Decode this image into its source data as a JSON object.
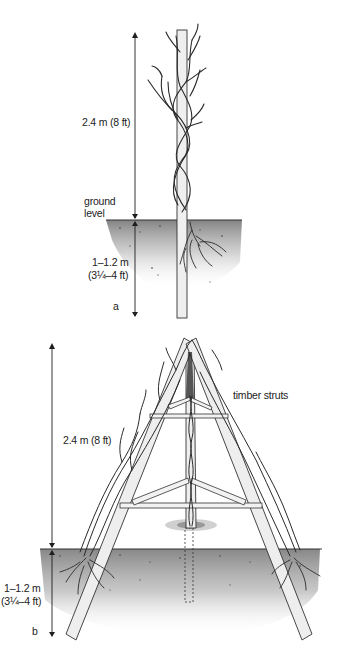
{
  "figure_a": {
    "panel_letter": "a",
    "height_above_label": "2.4 m (8 ft)",
    "ground_label_line1": "ground",
    "ground_label_line2": "level",
    "depth_label_line1": "1–1.2 m",
    "depth_label_line2": "(3¼–4 ft)",
    "support_type": "single-post",
    "icon": "vine-on-post-icon"
  },
  "figure_b": {
    "panel_letter": "b",
    "height_above_label": "2.4 m (8 ft)",
    "struts_label": "timber struts",
    "depth_label_line1": "1–1.2 m",
    "depth_label_line2": "(3¼–4 ft)",
    "support_type": "tripod",
    "icon": "vine-on-tripod-icon"
  },
  "colors": {
    "ink": "#1e1e1e",
    "soil": "#8a8a8a",
    "post_fill": "#efefef",
    "background": "#ffffff"
  }
}
